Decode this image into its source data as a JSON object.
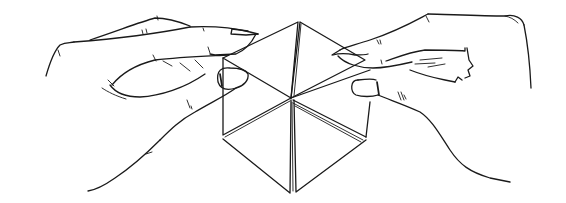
{
  "figure": {
    "description": "Line drawing of two hands holding and flexing a hexagonal paper hexaflexagon",
    "colors": {
      "background": "#ffffff",
      "ink": "#1a1a1a"
    },
    "elements": [
      "left-hand",
      "right-hand",
      "hexaflexagon"
    ]
  }
}
